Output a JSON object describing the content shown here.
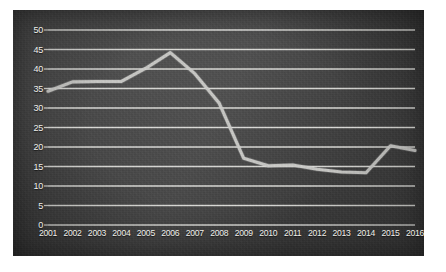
{
  "chart_data": {
    "type": "line",
    "title": "",
    "subtitle": "",
    "xlabel": "",
    "ylabel": "",
    "categories": [
      "2001",
      "2002",
      "2003",
      "2004",
      "2005",
      "2006",
      "2007",
      "2008",
      "2009",
      "2010",
      "2011",
      "2012",
      "2013",
      "2014",
      "2015",
      "2016"
    ],
    "values": [
      34.3,
      36.7,
      36.8,
      36.8,
      40.2,
      44.2,
      38.8,
      31.2,
      17.1,
      15.2,
      15.4,
      14.3,
      13.6,
      13.4,
      20.3,
      19.1
    ],
    "series": [
      {
        "name": "series-1",
        "values": [
          34.3,
          36.7,
          36.8,
          36.8,
          40.2,
          44.2,
          38.8,
          31.2,
          17.1,
          15.2,
          15.4,
          14.3,
          13.6,
          13.4,
          20.3,
          19.1
        ]
      }
    ],
    "ylim": [
      0,
      50
    ],
    "yticks": [
      0,
      5,
      10,
      15,
      20,
      25,
      30,
      35,
      40,
      45,
      50
    ],
    "ytick_labels": [
      "0",
      "5",
      "10",
      "15",
      "20",
      "25",
      "30",
      "35",
      "40",
      "45",
      "50"
    ],
    "xtick_labels": [
      "2001",
      "2002",
      "2003",
      "2004",
      "2005",
      "2006",
      "2007",
      "2008",
      "2009",
      "2010",
      "2011",
      "2012",
      "2013",
      "2014",
      "2015",
      "2016"
    ],
    "grid": true,
    "grid_axis": "y",
    "legend": false,
    "legend_position": "none",
    "annotations": []
  },
  "style": {
    "panel_background": "#484848",
    "gridline_color": "#e8e8e4",
    "line_color": "#cfcfcb",
    "tick_label_color": "#efefea",
    "page_background": "#ffffff"
  }
}
